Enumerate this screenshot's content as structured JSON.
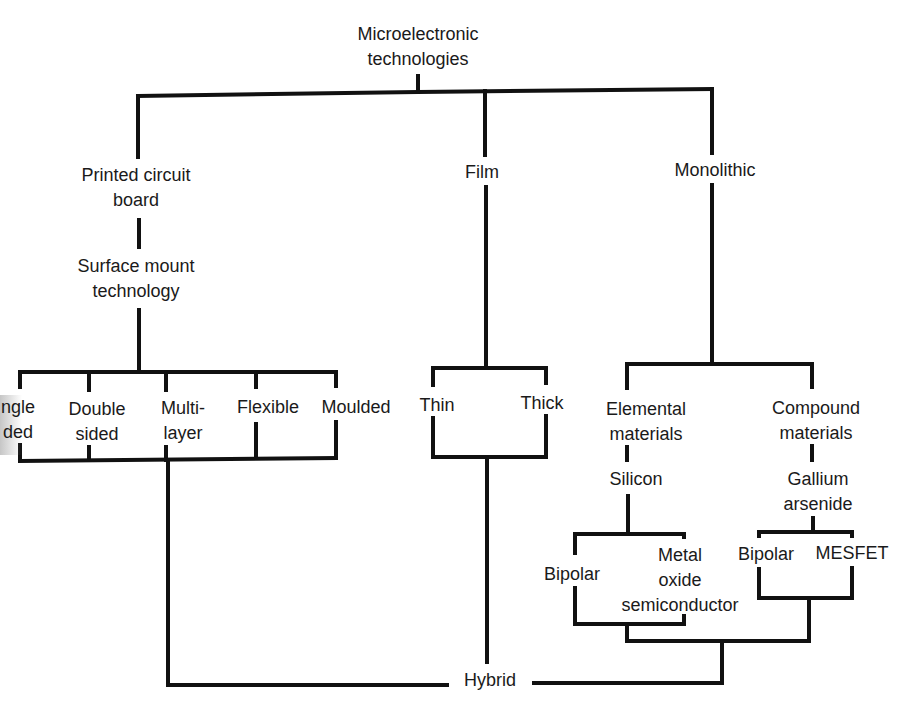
{
  "diagram": {
    "type": "tree",
    "title": "Microelectronic technologies",
    "line_color": "#111111",
    "nodes": {
      "root": {
        "line1": "Microelectronic",
        "line2": "technologies"
      },
      "pcb": {
        "line1": "Printed circuit",
        "line2": "board"
      },
      "smt": {
        "line1": "Surface mount",
        "line2": "technology"
      },
      "film": {
        "line1": "Film"
      },
      "monolithic": {
        "line1": "Monolithic"
      },
      "single_sided": {
        "line1": "Single",
        "line2": "sided",
        "visible_line1": "ngle",
        "visible_line2": "ded"
      },
      "double_sided": {
        "line1": "Double",
        "line2": "sided"
      },
      "multilayer": {
        "line1": "Multi-",
        "line2": "layer"
      },
      "flexible": {
        "line1": "Flexible"
      },
      "moulded": {
        "line1": "Moulded"
      },
      "thin": {
        "line1": "Thin"
      },
      "thick": {
        "line1": "Thick"
      },
      "elemental": {
        "line1": "Elemental",
        "line2": "materials"
      },
      "compound": {
        "line1": "Compound",
        "line2": "materials"
      },
      "silicon": {
        "line1": "Silicon"
      },
      "gaas": {
        "line1": "Gallium",
        "line2": "arsenide"
      },
      "si_bipolar": {
        "line1": "Bipolar"
      },
      "mos": {
        "line1": "Metal",
        "line2": "oxide",
        "line3": "semiconductor"
      },
      "gaas_bipolar": {
        "line1": "Bipolar"
      },
      "mesfet": {
        "line1": "MESFET"
      },
      "hybrid": {
        "line1": "Hybrid"
      }
    },
    "edges": [
      [
        "Microelectronic technologies",
        "Printed circuit board"
      ],
      [
        "Microelectronic technologies",
        "Film"
      ],
      [
        "Microelectronic technologies",
        "Monolithic"
      ],
      [
        "Printed circuit board",
        "Surface mount technology"
      ],
      [
        "Surface mount technology",
        "Single sided"
      ],
      [
        "Surface mount technology",
        "Double sided"
      ],
      [
        "Surface mount technology",
        "Multi-layer"
      ],
      [
        "Surface mount technology",
        "Flexible"
      ],
      [
        "Surface mount technology",
        "Moulded"
      ],
      [
        "Film",
        "Thin"
      ],
      [
        "Film",
        "Thick"
      ],
      [
        "Monolithic",
        "Elemental materials"
      ],
      [
        "Monolithic",
        "Compound materials"
      ],
      [
        "Elemental materials",
        "Silicon"
      ],
      [
        "Compound materials",
        "Gallium arsenide"
      ],
      [
        "Silicon",
        "Bipolar"
      ],
      [
        "Silicon",
        "Metal oxide semiconductor"
      ],
      [
        "Gallium arsenide",
        "Bipolar"
      ],
      [
        "Gallium arsenide",
        "MESFET"
      ],
      [
        "PCB group",
        "Hybrid"
      ],
      [
        "Film group",
        "Hybrid"
      ],
      [
        "Monolithic group",
        "Hybrid"
      ]
    ]
  }
}
